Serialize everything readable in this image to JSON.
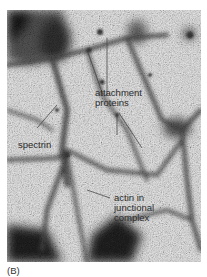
{
  "figure": {
    "panel_label": "(B)",
    "image_description": "Negatively stained electron micrograph of the spectrin-actin membrane skeleton network",
    "labels": {
      "attachment_proteins": [
        "attachment",
        "proteins"
      ],
      "spectrin": "spectrin",
      "actin_junctional": [
        "actin in",
        "junctional",
        "complex"
      ]
    },
    "colors": {
      "background": "#ffffff",
      "micrograph_base": "#c9c9c9",
      "strand": "#4a4a4a",
      "dark_region": "#1e1e1e",
      "label_text": "#2a2a2a"
    }
  }
}
